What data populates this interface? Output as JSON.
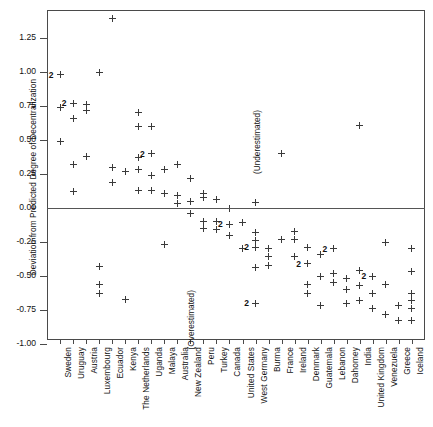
{
  "chart_data": {
    "type": "scatter",
    "title": "",
    "xlabel": "",
    "ylabel": "Deviation from Predicted Degree of Decentralization",
    "ylim": [
      -1.0,
      1.45
    ],
    "yticks": [
      1.25,
      1.0,
      0.75,
      0.5,
      0.25,
      0.0,
      -0.25,
      -0.5,
      -0.75,
      -1.0
    ],
    "ytick_labels": [
      "1.25",
      "1.00",
      "0.75",
      "0.50",
      "0.25",
      "0.00",
      "-0.25",
      "-0.50",
      "-0.75",
      "-1.00"
    ],
    "grid": false,
    "legend": null,
    "reference_line": 0.0,
    "annotations": [
      {
        "text": "(Underestimated)",
        "x_category": "West Germany",
        "y": 0.72,
        "orientation": "vertical"
      },
      {
        "text": "(Overestimated)",
        "x_category": "New Zealand",
        "y": -0.6,
        "orientation": "vertical"
      }
    ],
    "categories": [
      "Sweden",
      "Uruguay",
      "Austria",
      "Luxembourg",
      "Ecuador",
      "Kenya",
      "The Netherlands",
      "Uganda",
      "Malaya",
      "Australia",
      "New Zealand",
      "Peru",
      "Turkey",
      "Canada",
      "United States",
      "West Germany",
      "Burma",
      "France",
      "Ireland",
      "Denmark",
      "Guatemala",
      "Lebanon",
      "Dahomey",
      "India",
      "United Kingdom",
      "Venezuela",
      "Greece",
      "Iceland"
    ],
    "points": [
      {
        "c": "Sweden",
        "y": 0.98,
        "n": 2
      },
      {
        "c": "Sweden",
        "y": 0.74,
        "n": 1
      },
      {
        "c": "Sweden",
        "y": 0.49,
        "n": 1
      },
      {
        "c": "Uruguay",
        "y": 0.77,
        "n": 2
      },
      {
        "c": "Uruguay",
        "y": 0.66,
        "n": 1
      },
      {
        "c": "Uruguay",
        "y": 0.32,
        "n": 1
      },
      {
        "c": "Uruguay",
        "y": 0.12,
        "n": 1
      },
      {
        "c": "Austria",
        "y": 0.76,
        "n": 1
      },
      {
        "c": "Austria",
        "y": 0.72,
        "n": 1
      },
      {
        "c": "Austria",
        "y": 0.38,
        "n": 1
      },
      {
        "c": "Luxembourg",
        "y": 1.0,
        "n": 1
      },
      {
        "c": "Luxembourg",
        "y": -0.43,
        "n": 1
      },
      {
        "c": "Luxembourg",
        "y": -0.56,
        "n": 1
      },
      {
        "c": "Luxembourg",
        "y": -0.63,
        "n": 1
      },
      {
        "c": "Ecuador",
        "y": 1.39,
        "n": 1
      },
      {
        "c": "Ecuador",
        "y": 0.3,
        "n": 1
      },
      {
        "c": "Ecuador",
        "y": 0.19,
        "n": 1
      },
      {
        "c": "Kenya",
        "y": 0.27,
        "n": 1
      },
      {
        "c": "Kenya",
        "y": -0.67,
        "n": 1
      },
      {
        "c": "The Netherlands",
        "y": 0.7,
        "n": 1
      },
      {
        "c": "The Netherlands",
        "y": 0.6,
        "n": 1
      },
      {
        "c": "The Netherlands",
        "y": 0.37,
        "n": 1
      },
      {
        "c": "The Netherlands",
        "y": 0.28,
        "n": 1
      },
      {
        "c": "The Netherlands",
        "y": 0.13,
        "n": 1
      },
      {
        "c": "Uganda",
        "y": 0.6,
        "n": 1
      },
      {
        "c": "Uganda",
        "y": 0.4,
        "n": 2
      },
      {
        "c": "Uganda",
        "y": 0.24,
        "n": 1
      },
      {
        "c": "Uganda",
        "y": 0.13,
        "n": 1
      },
      {
        "c": "Malaya",
        "y": 0.28,
        "n": 1
      },
      {
        "c": "Malaya",
        "y": 0.11,
        "n": 1
      },
      {
        "c": "Malaya",
        "y": -0.27,
        "n": 1
      },
      {
        "c": "Australia",
        "y": 0.32,
        "n": 1
      },
      {
        "c": "Australia",
        "y": 0.09,
        "n": 1
      },
      {
        "c": "Australia",
        "y": 0.03,
        "n": 1
      },
      {
        "c": "New Zealand",
        "y": 0.22,
        "n": 1
      },
      {
        "c": "New Zealand",
        "y": 0.05,
        "n": 1
      },
      {
        "c": "New Zealand",
        "y": -0.04,
        "n": 1
      },
      {
        "c": "Peru",
        "y": 0.11,
        "n": 1
      },
      {
        "c": "Peru",
        "y": 0.08,
        "n": 1
      },
      {
        "c": "Peru",
        "y": -0.1,
        "n": 1
      },
      {
        "c": "Peru",
        "y": -0.15,
        "n": 1
      },
      {
        "c": "Turkey",
        "y": 0.06,
        "n": 1
      },
      {
        "c": "Turkey",
        "y": -0.1,
        "n": 1
      },
      {
        "c": "Turkey",
        "y": -0.16,
        "n": 1
      },
      {
        "c": "Canada",
        "y": 0.0,
        "n": 1
      },
      {
        "c": "Canada",
        "y": -0.12,
        "n": 2
      },
      {
        "c": "Canada",
        "y": -0.2,
        "n": 1
      },
      {
        "c": "United States",
        "y": -0.11,
        "n": 1
      },
      {
        "c": "United States",
        "y": -0.3,
        "n": 1
      },
      {
        "c": "West Germany",
        "y": 0.04,
        "n": 1
      },
      {
        "c": "West Germany",
        "y": -0.18,
        "n": 1
      },
      {
        "c": "West Germany",
        "y": -0.24,
        "n": 1
      },
      {
        "c": "West Germany",
        "y": -0.29,
        "n": 2
      },
      {
        "c": "West Germany",
        "y": -0.44,
        "n": 1
      },
      {
        "c": "West Germany",
        "y": -0.7,
        "n": 2
      },
      {
        "c": "Burma",
        "y": -0.36,
        "n": 1
      },
      {
        "c": "Burma",
        "y": -0.42,
        "n": 1
      },
      {
        "c": "Burma",
        "y": -0.3,
        "n": 1
      },
      {
        "c": "France",
        "y": 0.4,
        "n": 1
      },
      {
        "c": "France",
        "y": -0.23,
        "n": 1
      },
      {
        "c": "Ireland",
        "y": -0.17,
        "n": 1
      },
      {
        "c": "Ireland",
        "y": -0.23,
        "n": 1
      },
      {
        "c": "Ireland",
        "y": -0.36,
        "n": 1
      },
      {
        "c": "Denmark",
        "y": -0.29,
        "n": 1
      },
      {
        "c": "Denmark",
        "y": -0.41,
        "n": 2
      },
      {
        "c": "Denmark",
        "y": -0.56,
        "n": 1
      },
      {
        "c": "Denmark",
        "y": -0.63,
        "n": 1
      },
      {
        "c": "Guatemala",
        "y": -0.34,
        "n": 1
      },
      {
        "c": "Guatemala",
        "y": -0.5,
        "n": 1
      },
      {
        "c": "Guatemala",
        "y": -0.72,
        "n": 1
      },
      {
        "c": "Lebanon",
        "y": -0.3,
        "n": 2
      },
      {
        "c": "Lebanon",
        "y": -0.48,
        "n": 1
      },
      {
        "c": "Lebanon",
        "y": -0.55,
        "n": 1
      },
      {
        "c": "Dahomey",
        "y": -0.52,
        "n": 1
      },
      {
        "c": "Dahomey",
        "y": -0.6,
        "n": 1
      },
      {
        "c": "Dahomey",
        "y": -0.7,
        "n": 1
      },
      {
        "c": "India",
        "y": 0.61,
        "n": 1
      },
      {
        "c": "India",
        "y": -0.46,
        "n": 1
      },
      {
        "c": "India",
        "y": -0.57,
        "n": 1
      },
      {
        "c": "India",
        "y": -0.68,
        "n": 1
      },
      {
        "c": "United Kingdom",
        "y": -0.5,
        "n": 2
      },
      {
        "c": "United Kingdom",
        "y": -0.63,
        "n": 1
      },
      {
        "c": "United Kingdom",
        "y": -0.74,
        "n": 1
      },
      {
        "c": "Venezuela",
        "y": -0.25,
        "n": 1
      },
      {
        "c": "Venezuela",
        "y": -0.56,
        "n": 1
      },
      {
        "c": "Venezuela",
        "y": -0.78,
        "n": 1
      },
      {
        "c": "Greece",
        "y": -0.72,
        "n": 1
      },
      {
        "c": "Greece",
        "y": -0.83,
        "n": 1
      },
      {
        "c": "Iceland",
        "y": -0.3,
        "n": 1
      },
      {
        "c": "Iceland",
        "y": -0.47,
        "n": 1
      },
      {
        "c": "Iceland",
        "y": -0.63,
        "n": 1
      },
      {
        "c": "Iceland",
        "y": -0.68,
        "n": 1
      },
      {
        "c": "Iceland",
        "y": -0.74,
        "n": 1
      },
      {
        "c": "Iceland",
        "y": -0.83,
        "n": 1
      }
    ]
  }
}
